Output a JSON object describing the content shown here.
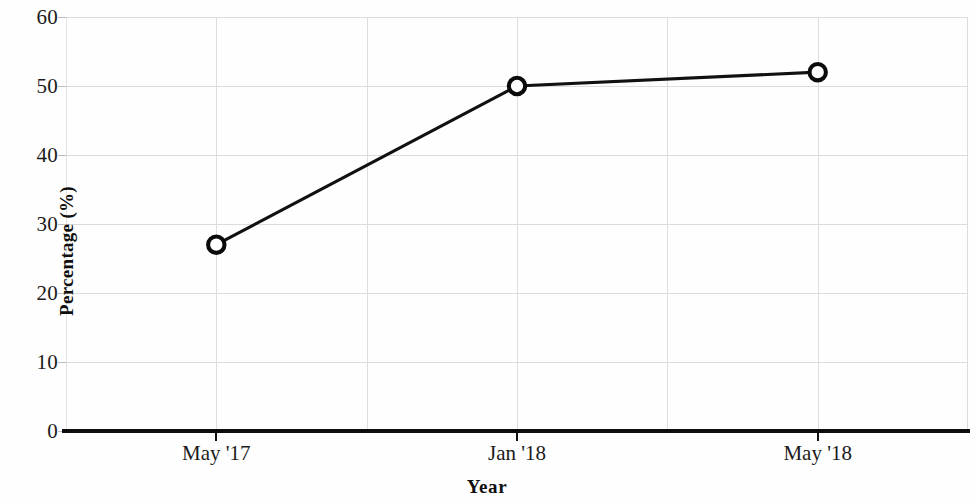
{
  "chart_data": {
    "type": "line",
    "title": "",
    "subtitle": "",
    "xlabel": "Year",
    "ylabel": "Percentage (%)",
    "categories": [
      "May '17",
      "Jan '18",
      "May '18"
    ],
    "values": [
      27,
      50,
      52
    ],
    "series": [
      {
        "name": "Percentage",
        "values": [
          27,
          50,
          52
        ]
      }
    ],
    "ylim": [
      0,
      60
    ],
    "y_ticks": [
      0,
      10,
      20,
      30,
      40,
      50,
      60
    ],
    "y_tick_labels": [
      "0",
      "10",
      "20",
      "30",
      "40",
      "50",
      "60"
    ],
    "x_tick_labels": [
      "May '17",
      "Jan '18",
      "May '18"
    ],
    "grid": true,
    "grid_color": "#dcdcdc",
    "legend": false,
    "legend_position": "none",
    "marker": "open-circle",
    "line_color": "#111111",
    "marker_face_color": "#ffffff",
    "marker_edge_color": "#0b0b0b",
    "axis_color": "#0d0d0d",
    "background": "#fefefe",
    "annotations": []
  }
}
